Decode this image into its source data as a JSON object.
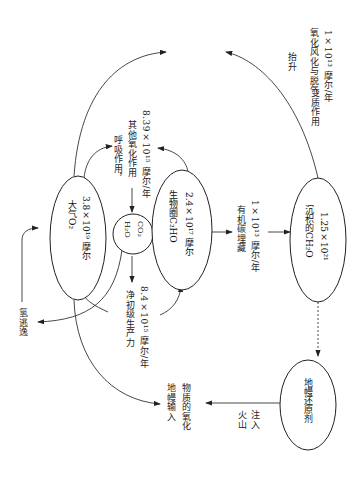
{
  "diagram": {
    "title": "",
    "orientation": "rotated-90-clockwise",
    "nodes": {
      "atmosphere": {
        "name": "大气O₂",
        "value": "3.8×10¹⁹ 摩尔"
      },
      "water_co2": {
        "line1": "H₂O",
        "line2": "CO₂"
      },
      "biosphere": {
        "name": "生物圈C₂HO",
        "value": "2.4×10¹⁷ 摩尔"
      },
      "sediment": {
        "name": "沉积的CH₂O",
        "value": "1.25×10²¹"
      },
      "mantle": {
        "name": "地幔还原剂"
      }
    },
    "labels": {
      "respiration": {
        "line1": "呼吸作用，",
        "line2": "其他氧化作用",
        "line3": "8.39×10¹⁵ 摩尔/年"
      },
      "npp": {
        "line1": "净初级生产力",
        "line2": "8.4×10¹⁵ 摩尔/年"
      },
      "burial": {
        "line1": "有机碳埋藏",
        "line2": "1×10¹³ 摩尔/年"
      },
      "weathering": {
        "line1": "氧化风化与脱气",
        "line2": "1×10¹³ 摩尔/年"
      },
      "uplift": "抬升",
      "metamorphism": "变质作用",
      "hydrogen_escape": "氢逃逸",
      "mantle_input": {
        "line1": "地幔输入",
        "line2": "物质的氧化"
      },
      "volcanic": {
        "line1": "火山",
        "line2": "注入"
      }
    }
  }
}
